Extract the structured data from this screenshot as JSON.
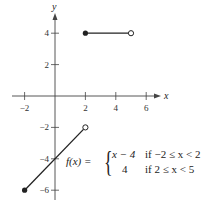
{
  "chart_data": {
    "type": "line",
    "title": "",
    "xlabel": "x",
    "ylabel": "y",
    "xlim": [
      -2.3,
      6.8
    ],
    "ylim": [
      -6.3,
      5.7
    ],
    "grid": false,
    "x_ticks": [
      -2,
      2,
      4,
      6
    ],
    "x_tick_labels": [
      "−2",
      "2",
      "4",
      "6"
    ],
    "y_ticks": [
      4,
      2,
      -2,
      -4,
      -6
    ],
    "y_tick_labels": [
      "4",
      "2",
      "−2",
      "−4",
      "−6"
    ],
    "series": [
      {
        "name": "x − 4 on −2 ≤ x < 2",
        "points": [
          [
            -2,
            -6
          ],
          [
            2,
            -2
          ]
        ],
        "start_endpoint": "closed",
        "end_endpoint": "open"
      },
      {
        "name": "4 on 2 ≤ x < 5",
        "points": [
          [
            2,
            4
          ],
          [
            5,
            4
          ]
        ],
        "start_endpoint": "closed",
        "end_endpoint": "open"
      }
    ],
    "annotations": [
      {
        "text": "f(x) = { x − 4 if −2 ≤ x < 2 ; 4 if 2 ≤ x < 5 }",
        "position": [
          1,
          -4.2
        ]
      }
    ]
  },
  "formula": {
    "lhs": "f(x) =",
    "brace": "{",
    "case1_expr": "x − 4",
    "case1_cond": "if  −2 ≤ x < 2",
    "case2_expr": "4",
    "case2_cond": "if  2 ≤ x < 5"
  },
  "axes": {
    "x_label": "x",
    "y_label": "y"
  },
  "colors": {
    "line": "#222222",
    "axis": "#444444"
  }
}
